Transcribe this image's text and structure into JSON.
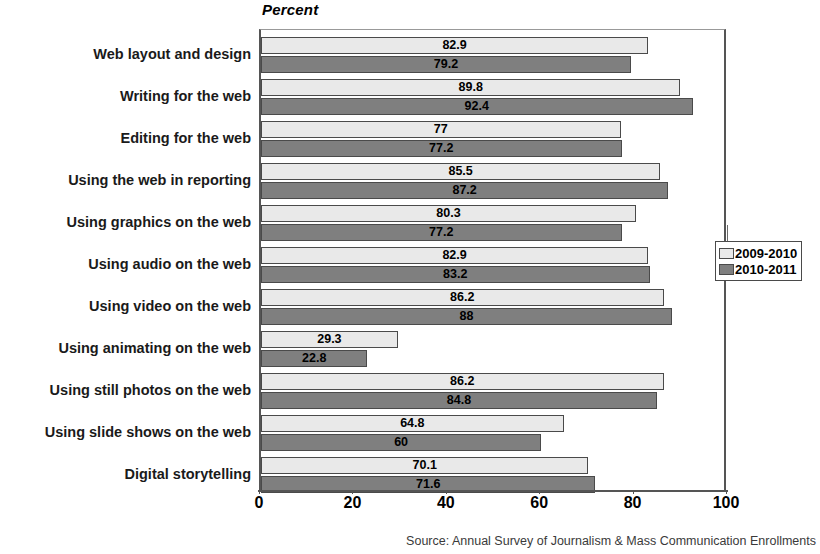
{
  "chart_data": {
    "type": "bar",
    "orientation": "horizontal",
    "title": "",
    "xlabel": "Percent",
    "ylabel": "",
    "xlim": [
      0,
      100
    ],
    "xticks": [
      0,
      20,
      40,
      60,
      80,
      100
    ],
    "grid": false,
    "legend_position": "right",
    "categories": [
      "Web layout and design",
      "Writing for the web",
      "Editing for the web",
      "Using the web in reporting",
      "Using graphics on the web",
      "Using audio on the web",
      "Using video on the web",
      "Using animating on the web",
      "Using still photos on the web",
      "Using slide shows on the web",
      "Digital storytelling"
    ],
    "series": [
      {
        "name": "2009-2010",
        "color": "#e9e9e9",
        "values": [
          82.9,
          89.8,
          77,
          85.5,
          80.3,
          82.9,
          86.2,
          29.3,
          86.2,
          64.8,
          70.1
        ],
        "labels": [
          "82.9",
          "89.8",
          "77",
          "85.5",
          "80.3",
          "82.9",
          "86.2",
          "29.3",
          "86.2",
          "64.8",
          "70.1"
        ]
      },
      {
        "name": "2010-2011",
        "color": "#7f7f7f",
        "values": [
          79.2,
          92.4,
          77.2,
          87.2,
          77.2,
          83.2,
          88,
          22.8,
          84.8,
          60,
          71.6
        ],
        "labels": [
          "79.2",
          "92.4",
          "77.2",
          "87.2",
          "77.2",
          "83.2",
          "88",
          "22.8",
          "84.8",
          "60",
          "71.6"
        ]
      }
    ]
  },
  "axis_title": "Percent",
  "source_note": "Source: Annual Survey of Journalism & Mass Communication Enrollments"
}
